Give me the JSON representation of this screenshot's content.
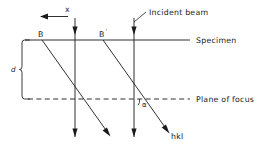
{
  "figure": {
    "type": "ray-diagram",
    "background_color": "#ffffff",
    "line_color": "#1a1a1a"
  },
  "labels": {
    "x_axis": "x",
    "incident_beam": "Incident beam",
    "specimen": "Specimen",
    "plane_of_focus": "Plane of focus",
    "depth": "d",
    "point_b": "B",
    "point_b_prime": "B",
    "point_b_prime_mark": "'",
    "alpha": "α",
    "hkl": "hkl"
  },
  "geometry": {
    "specimen_line_y": 40,
    "specimen_line_x_start": 25,
    "specimen_line_x_end": 190,
    "focus_line_y": 99,
    "focus_line_x_start": 28,
    "focus_line_x_end": 190,
    "beam_1_x": 75,
    "beam_2_x": 134,
    "beam_top_y": 18,
    "beam_bottom_y": 137,
    "diagonal_1_start_x": 42,
    "diagonal_2_start_x": 103,
    "brace_x": 22,
    "depth_label_x": 14,
    "x_arrow_y": 16,
    "x_arrow_left": 40,
    "x_arrow_right": 68
  }
}
